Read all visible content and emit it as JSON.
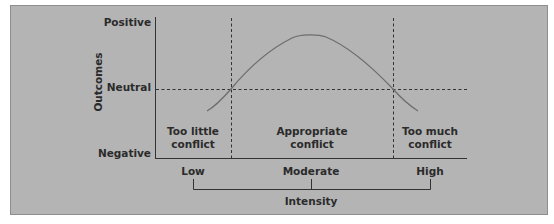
{
  "diagram": {
    "y_axis": {
      "title": "Outcomes",
      "levels": [
        "Positive",
        "Neutral",
        "Negative"
      ]
    },
    "x_axis": {
      "title": "Intensity",
      "levels": [
        "Low",
        "Moderate",
        "High"
      ]
    },
    "regions": [
      {
        "line1": "Too little",
        "line2": "conflict"
      },
      {
        "line1": "Appropriate",
        "line2": "conflict"
      },
      {
        "line1": "Too much",
        "line2": "conflict"
      }
    ],
    "curve": {
      "description": "Inverted-U relationship between conflict intensity and outcomes",
      "shape": "inverted-u",
      "crosses_neutral_at_region_boundaries": true
    },
    "colors": {
      "panel_bg": "#b4b4b4",
      "line": "#333333",
      "curve": "#6e6e6e"
    }
  }
}
